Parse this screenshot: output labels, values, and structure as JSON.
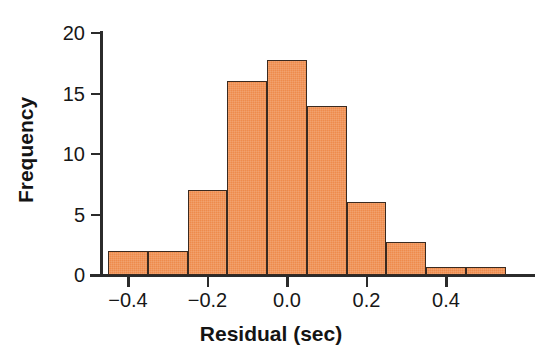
{
  "chart_data": {
    "type": "bar",
    "title": "",
    "subtitle": "",
    "xlabel": "Residual (sec)",
    "ylabel": "Frequency",
    "xlim": [
      -0.48,
      0.58
    ],
    "ylim": [
      0,
      20
    ],
    "grid": false,
    "legend": null,
    "bin_width": 0.1,
    "bar_color": "#ee8b4c",
    "bar_edge_color": "#3a2a20",
    "axis_color": "#2b2b2b",
    "xticks": [
      {
        "value": -0.4,
        "label": "−0.4"
      },
      {
        "value": -0.2,
        "label": "−0.2"
      },
      {
        "value": 0.0,
        "label": "0.0"
      },
      {
        "value": 0.2,
        "label": "0.2"
      },
      {
        "value": 0.4,
        "label": "0.4"
      }
    ],
    "yticks": [
      {
        "value": 0,
        "label": "0"
      },
      {
        "value": 5,
        "label": "5"
      },
      {
        "value": 10,
        "label": "10"
      },
      {
        "value": 15,
        "label": "15"
      },
      {
        "value": 20,
        "label": "20"
      }
    ],
    "bins": [
      {
        "left": -0.45,
        "right": -0.35,
        "center": -0.4,
        "value": 2.0
      },
      {
        "left": -0.35,
        "right": -0.25,
        "center": -0.3,
        "value": 2.0
      },
      {
        "left": -0.25,
        "right": -0.15,
        "center": -0.2,
        "value": 7.0
      },
      {
        "left": -0.15,
        "right": -0.05,
        "center": -0.1,
        "value": 16.0
      },
      {
        "left": -0.05,
        "right": 0.05,
        "center": 0.0,
        "value": 17.8
      },
      {
        "left": 0.05,
        "right": 0.15,
        "center": 0.1,
        "value": 14.0
      },
      {
        "left": 0.15,
        "right": 0.25,
        "center": 0.2,
        "value": 6.0
      },
      {
        "left": 0.25,
        "right": 0.35,
        "center": 0.3,
        "value": 2.7
      },
      {
        "left": 0.35,
        "right": 0.45,
        "center": 0.4,
        "value": 0.7
      },
      {
        "left": 0.45,
        "right": 0.55,
        "center": 0.5,
        "value": 0.7
      }
    ],
    "categories": [
      "-0.45..-0.35",
      "-0.35..-0.25",
      "-0.25..-0.15",
      "-0.15..-0.05",
      "-0.05..0.05",
      "0.05..0.15",
      "0.15..0.25",
      "0.25..0.35",
      "0.35..0.45",
      "0.45..0.55"
    ],
    "values": [
      2,
      2,
      7,
      16,
      17.8,
      14,
      6,
      2.7,
      0.7,
      0.7
    ]
  }
}
